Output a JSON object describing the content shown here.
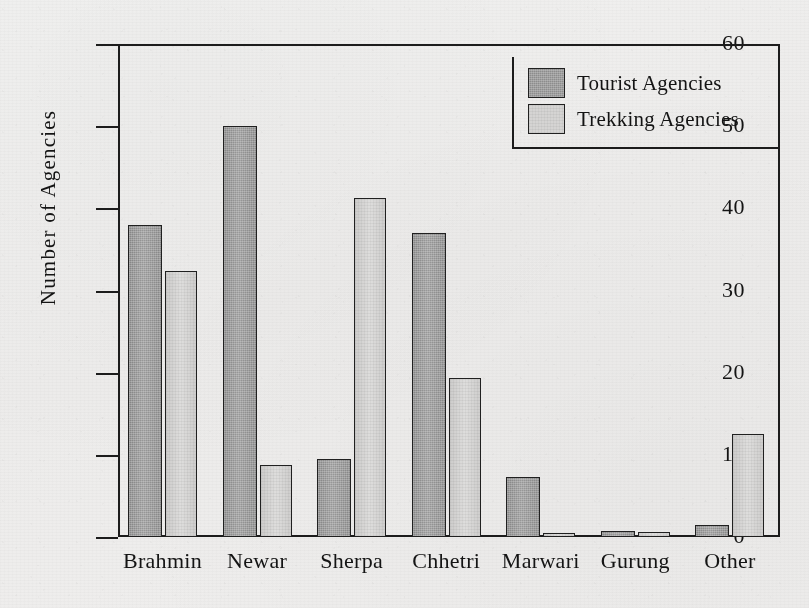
{
  "chart_data": {
    "type": "bar",
    "title": "",
    "subtitle": "",
    "xlabel": "",
    "ylabel": "Number of Agencies",
    "ylim": [
      0,
      60
    ],
    "ytick_labels": [
      "0",
      "10",
      "20",
      "30",
      "40",
      "50",
      "60"
    ],
    "yticks": [
      0,
      10,
      20,
      30,
      40,
      50,
      60
    ],
    "grid": false,
    "legend_position": "top-right",
    "categories": [
      "Brahmin",
      "Newar",
      "Sherpa",
      "Chhetri",
      "Marwari",
      "Gurung",
      "Other"
    ],
    "series": [
      {
        "name": "Tourist Agencies",
        "color": "#8d8d8d",
        "values": [
          38,
          50,
          9.5,
          37,
          7.3,
          0.7,
          1.5
        ]
      },
      {
        "name": "Trekking Agencies",
        "color": "#d6d4d0",
        "values": [
          32.4,
          8.8,
          41.3,
          19.3,
          0.5,
          0.6,
          12.5
        ]
      }
    ]
  },
  "legend": {
    "entries": [
      {
        "label": "Tourist Agencies",
        "swatch": "tourist"
      },
      {
        "label": "Trekking Agencies",
        "swatch": "trekking"
      }
    ]
  },
  "colors": {
    "tourist": "#8d8d8d",
    "trekking": "#d6d4d0",
    "axis": "#1c1c1c",
    "text": "#141414",
    "paper": "#f1efeb"
  }
}
